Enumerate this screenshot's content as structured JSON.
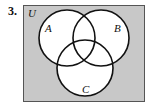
{
  "problem": {
    "number": "3."
  },
  "diagram": {
    "type": "venn",
    "universe_label": "U",
    "sets": [
      {
        "label": "A"
      },
      {
        "label": "B"
      },
      {
        "label": "C"
      }
    ],
    "colors": {
      "universe_fill": "#c8c8c8",
      "circle_fill": "#ffffff",
      "stroke": "#111111"
    }
  }
}
